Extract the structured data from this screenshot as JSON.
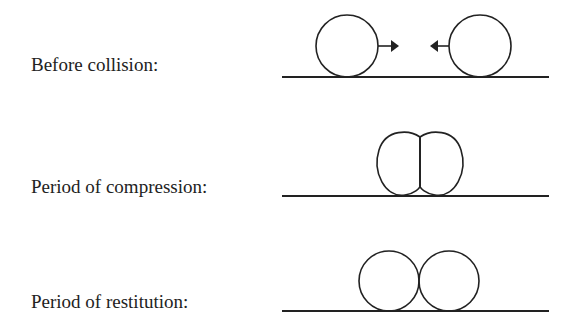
{
  "diagram": {
    "stroke_color": "#222222",
    "rows": [
      {
        "label": "Before collision:",
        "depiction": "two separate circles on a ground line with arrows pointing toward each other"
      },
      {
        "label": "Period of compression:",
        "depiction": "two deformed spheres pressed together with a flat shared contact face"
      },
      {
        "label": "Period of restitution:",
        "depiction": "two circles touching at a single point on a ground line"
      }
    ]
  }
}
